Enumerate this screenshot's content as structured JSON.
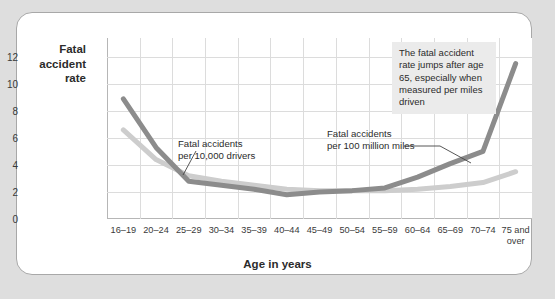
{
  "figure": {
    "background_color": "#dedede",
    "panel_color": "#ffffff",
    "border_color": "#a8a8a8"
  },
  "annotation": {
    "text": "The fatal accident rate jumps after age 65, especially when measured per miles driven",
    "background_color": "#ebebeb"
  },
  "callouts": {
    "drivers": "Fatal accidents\nper 10,000 drivers",
    "miles": "Fatal accidents\nper 100 million miles"
  },
  "chart_data": {
    "type": "line",
    "title": "",
    "xlabel": "Age in years",
    "ylabel": "Fatal accident rate",
    "ylabel_lines": [
      "Fatal",
      "accident",
      "rate"
    ],
    "categories": [
      "16–19",
      "20–24",
      "25–29",
      "30–34",
      "35–39",
      "40–44",
      "45–49",
      "50–54",
      "55–59",
      "60–64",
      "65–69",
      "70–74",
      "75 and\nover"
    ],
    "ylim": [
      0,
      13.4
    ],
    "yticks": [
      0,
      2,
      4,
      6,
      8,
      10,
      12
    ],
    "ytick_labels": [
      "0",
      "2",
      "4",
      "6",
      "8",
      "10",
      "12"
    ],
    "grid": true,
    "legend": "inline-callouts",
    "series": [
      {
        "name": "Fatal accidents per 100 million miles",
        "color": "#8c8c8c",
        "width": 5,
        "values": [
          8.9,
          5.3,
          2.8,
          2.5,
          2.2,
          1.8,
          2.0,
          2.1,
          2.3,
          3.1,
          4.1,
          5.0,
          11.5
        ]
      },
      {
        "name": "Fatal accidents per 10,000 drivers",
        "color": "#cdcdcd",
        "width": 5,
        "values": [
          6.6,
          4.4,
          3.2,
          2.8,
          2.5,
          2.2,
          2.1,
          2.1,
          2.1,
          2.2,
          2.4,
          2.7,
          3.5
        ]
      }
    ]
  }
}
